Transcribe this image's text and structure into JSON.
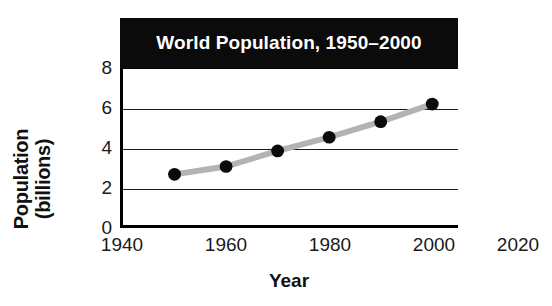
{
  "chart_data": {
    "type": "line",
    "title": "World Population, 1950–2000",
    "xlabel": "Year",
    "ylabel": "Population (billions)",
    "ylabel_lines": [
      "Population",
      "(billions)"
    ],
    "x": [
      1950,
      1960,
      1970,
      1980,
      1990,
      2000
    ],
    "values": [
      2.6,
      3.0,
      3.8,
      4.5,
      5.3,
      6.2
    ],
    "series": [
      {
        "name": "World Population",
        "values": [
          2.6,
          3.0,
          3.8,
          4.5,
          5.3,
          6.2
        ]
      }
    ],
    "xlim": [
      1940,
      2005
    ],
    "ylim": [
      0,
      8
    ],
    "xticks": [
      1940,
      1960,
      1980,
      2000,
      2020
    ],
    "xtick_labels": [
      "1940",
      "1960",
      "1980",
      "2000",
      "2020"
    ],
    "yticks": [
      0,
      2,
      4,
      6,
      8
    ],
    "ytick_labels": [
      "0",
      "2",
      "4",
      "6",
      "8"
    ],
    "grid": "horizontal",
    "legend": "none",
    "line_color": "#b3b3b3",
    "marker_color": "#0b0b0b",
    "title_background": "#0b0b0b",
    "title_color": "#ffffff",
    "axis_color": "#000000",
    "background": "#ffffff"
  }
}
